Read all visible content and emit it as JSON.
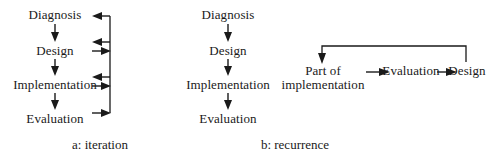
{
  "figure": {
    "width": 490,
    "height": 166,
    "background": "#ffffff",
    "ink_color": "#1a1a1a"
  },
  "panel_a": {
    "caption": "a: iteration",
    "caption_x": 100,
    "caption_y": 137,
    "nodes": [
      {
        "label": "Diagnosis",
        "x": 55,
        "y": 8
      },
      {
        "label": "Design",
        "x": 55,
        "y": 44
      },
      {
        "label": "Implementation",
        "x": 55,
        "y": 78
      },
      {
        "label": "Evaluation",
        "x": 55,
        "y": 112
      }
    ],
    "down_arrows": [
      {
        "x": 55,
        "y1": 24,
        "y2": 41
      },
      {
        "x": 55,
        "y1": 59,
        "y2": 76
      },
      {
        "x": 55,
        "y1": 93,
        "y2": 110
      }
    ],
    "feedback_bar": {
      "x": 110,
      "y_top": 16,
      "y_bottom": 113
    },
    "feedback_arrows": [
      {
        "label": "return-to-diagnosis",
        "dir": "left",
        "y": 16,
        "from_x": 110,
        "to_x": 93
      },
      {
        "label": "return-to-design",
        "dir": "left",
        "y": 42,
        "from_x": 110,
        "to_x": 93
      },
      {
        "label": "from-design",
        "dir": "right",
        "y": 51,
        "from_x": 93,
        "to_x": 110
      },
      {
        "label": "return-to-implementation",
        "dir": "left",
        "y": 77,
        "from_x": 110,
        "to_x": 93
      },
      {
        "label": "from-implementation",
        "dir": "right",
        "y": 86,
        "from_x": 93,
        "to_x": 110
      },
      {
        "label": "from-evaluation",
        "dir": "right",
        "y": 113,
        "from_x": 93,
        "to_x": 110
      }
    ]
  },
  "panel_b": {
    "caption": "b: recurrence",
    "caption_x": 295,
    "caption_y": 137,
    "nodes": [
      {
        "label": "Diagnosis",
        "x": 228,
        "y": 8
      },
      {
        "label": "Design",
        "x": 228,
        "y": 44
      },
      {
        "label": "Implementation",
        "x": 228,
        "y": 78
      },
      {
        "label": "Evaluation",
        "x": 228,
        "y": 112
      }
    ],
    "down_arrows": [
      {
        "x": 228,
        "y1": 24,
        "y2": 41
      },
      {
        "x": 228,
        "y1": 59,
        "y2": 76
      },
      {
        "x": 228,
        "y1": 93,
        "y2": 110
      }
    ],
    "recurrence": {
      "nodes": [
        {
          "label_line1": "Part of",
          "label_line2": "implementation",
          "x": 323,
          "y": 70
        },
        {
          "label_line1": "Evaluation",
          "label_line2": "",
          "x": 411,
          "y": 70
        },
        {
          "label_line1": "Design",
          "label_line2": "",
          "x": 467,
          "y": 70
        }
      ],
      "right_arrows": [
        {
          "label": "to-evaluation",
          "y": 72,
          "from_x": 357,
          "to_x": 385
        },
        {
          "label": "to-design",
          "y": 72,
          "from_x": 436,
          "to_x": 454
        }
      ],
      "loop": {
        "label": "design-back-to-implementation",
        "start_x": 466,
        "top_y": 46,
        "end_x": 322,
        "bottom_y": 62,
        "right_y": 62
      }
    }
  }
}
